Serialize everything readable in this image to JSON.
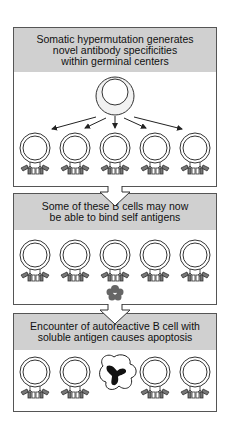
{
  "panels": [
    {
      "header": "Somatic hypermutation generates\nnovel antibody specificities\nwithin germinal centers"
    },
    {
      "header": "Some of these B cells may now\nbe able to bind self antigens"
    },
    {
      "header": "Encounter of autoreactive B cell with\nsoluble antigen causes apoptosis"
    }
  ],
  "colors": {
    "header_bg": "#d0d0d0",
    "border": "#555555",
    "antigen": "#666666",
    "apoptotic_nucleus": "#111111"
  }
}
